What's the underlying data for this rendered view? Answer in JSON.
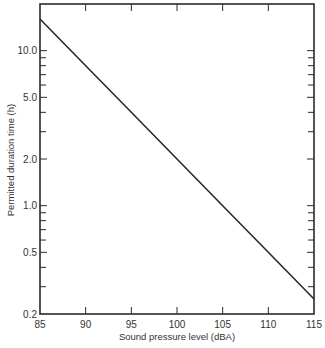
{
  "chart_data": {
    "type": "line",
    "title": "",
    "xlabel": "Sound pressure level (dBA)",
    "ylabel": "Permitted duration time (h)",
    "xscale": "linear",
    "yscale": "log",
    "xlim": [
      85,
      115
    ],
    "ylim": [
      0.2,
      20
    ],
    "grid": false,
    "legend": null,
    "x_ticks": [
      85,
      90,
      95,
      100,
      105,
      110,
      115
    ],
    "x_tick_labels": [
      "85",
      "90",
      "95",
      "100",
      "105",
      "110",
      "115"
    ],
    "y_ticks": [
      0.2,
      0.5,
      1.0,
      2.0,
      5.0,
      10.0
    ],
    "y_tick_labels": [
      "0.2",
      "0.5",
      "1.0",
      "2.0",
      "5.0",
      "10.0"
    ],
    "series": [
      {
        "name": "Permitted duration",
        "x": [
          85,
          90,
          95,
          100,
          105,
          110,
          115
        ],
        "y": [
          16,
          8,
          4,
          2,
          1,
          0.5,
          0.25
        ]
      }
    ],
    "colors": {
      "line": "#2a2a2a",
      "frame": "#2a2a2a"
    }
  }
}
